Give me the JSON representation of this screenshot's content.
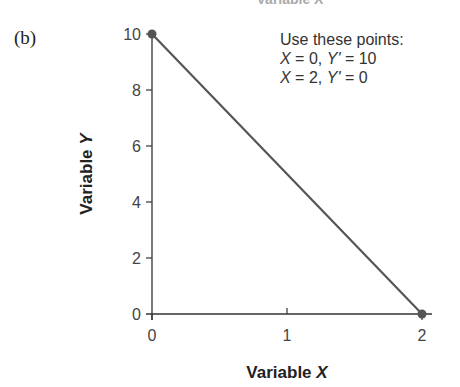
{
  "figure": {
    "panel_label": "(b)",
    "cut_off_top_text": "Variable X"
  },
  "annotation": {
    "line1": "Use these points:",
    "line2_x": "X",
    "line2_rest": " = 0, ",
    "line2_y": "Y'",
    "line2_val": " = 10",
    "line3_x": "X",
    "line3_rest": " = 2, ",
    "line3_y": "Y'",
    "line3_val": " = 0"
  },
  "colors": {
    "line": "#555555",
    "point": "#555555",
    "axis": "#333333"
  },
  "chart_data": {
    "type": "line",
    "title": "",
    "xlabel": "Variable X",
    "ylabel": "Variable Y",
    "xlim": [
      0,
      2
    ],
    "ylim": [
      0,
      10
    ],
    "x_ticks": [
      0,
      1,
      2
    ],
    "y_ticks": [
      0,
      2,
      4,
      6,
      8,
      10
    ],
    "grid": false,
    "legend": null,
    "series": [
      {
        "name": "Regression line Y' = 10 - 5X",
        "x": [
          0,
          2
        ],
        "y": [
          10,
          0
        ]
      }
    ],
    "points": [
      {
        "x": 0,
        "y": 10
      },
      {
        "x": 2,
        "y": 0
      }
    ],
    "annotations": [
      "Use these points:",
      "X = 0, Y' = 10",
      "X = 2, Y' = 0"
    ]
  }
}
